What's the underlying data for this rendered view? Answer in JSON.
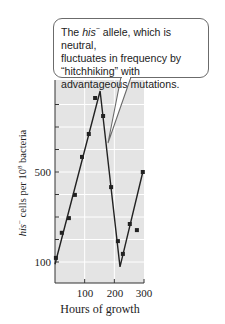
{
  "callout": {
    "line1_pre": "The ",
    "line1_italic": "his",
    "line1_sup": "−",
    "line1_post": " allele, which is neutral,",
    "line2": "fluctuates in frequency by",
    "line3": "“hitchhiking” with",
    "line4": "advantageous mutations."
  },
  "axes": {
    "xlabel": "Hours of growth",
    "ylabel_italic": "his",
    "ylabel_sup": "−",
    "ylabel_mid": " cells per 10",
    "ylabel_exp": "8",
    "ylabel_post": " bacteria",
    "xticks": [
      "100",
      "200",
      "300"
    ],
    "yticks": [
      "100",
      "500"
    ]
  },
  "colors": {
    "plot_bg": "#e4e4e4",
    "grid": "#ffffff",
    "line": "#222222",
    "points": "#222222"
  },
  "chart_data": {
    "type": "line",
    "title": "",
    "xlabel": "Hours of growth",
    "ylabel": "his− cells per 10^8 bacteria",
    "xlim": [
      0,
      300
    ],
    "ylim": [
      0,
      900
    ],
    "x_tick_labels": [
      "100",
      "200",
      "300"
    ],
    "y_tick_labels": [
      "100",
      "500"
    ],
    "y_minor_ticks": [
      200,
      300,
      400,
      600,
      700,
      800
    ],
    "grid": true,
    "series": [
      {
        "name": "observed data points",
        "type": "scatter",
        "x": [
          3,
          23,
          47,
          67,
          91,
          114,
          135,
          162,
          189,
          212,
          229,
          252,
          276,
          296
        ],
        "y": [
          118,
          230,
          295,
          398,
          567,
          669,
          829,
          749,
          433,
          193,
          136,
          269,
          242,
          500
        ]
      },
      {
        "name": "fitted trend",
        "type": "line",
        "x": [
          0,
          152,
          219,
          296
        ],
        "y": [
          90,
          860,
          78,
          500
        ]
      }
    ],
    "annotations": [
      {
        "text": "The his− allele, which is neutral, fluctuates in frequency by “hitchhiking” with advantageous mutations.",
        "points_to": [
          165,
          520
        ]
      }
    ]
  }
}
